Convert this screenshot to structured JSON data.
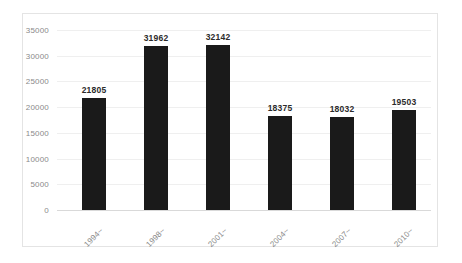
{
  "chart_data": {
    "type": "bar",
    "title": "",
    "subtitle": "",
    "xlabel": "",
    "ylabel": "",
    "categories": [
      "1994~",
      "1998~",
      "2001~",
      "2004~",
      "2007~",
      "2010~"
    ],
    "values": [
      21805,
      31962,
      32142,
      18375,
      18032,
      19503
    ],
    "data_labels": [
      "21805",
      "31962",
      "32142",
      "18375",
      "18032",
      "19503"
    ],
    "ylim": [
      0,
      35000
    ],
    "ytick_values": [
      0,
      5000,
      10000,
      15000,
      20000,
      25000,
      30000,
      35000
    ],
    "ytick_labels": [
      "0",
      "5000",
      "10000",
      "15000",
      "20000",
      "25000",
      "30000",
      "35000"
    ],
    "grid": true,
    "legend": false,
    "legend_position": "none",
    "series": [
      {
        "name": "",
        "values": [
          21805,
          31962,
          32142,
          18375,
          18032,
          19503
        ]
      }
    ]
  },
  "style": {
    "bar_color": "#1a1a1a",
    "gridline_color": "#efefef",
    "axis_color": "#d9d9d9",
    "frame_color": "#e4e4e4",
    "tick_label_color": "#8a8a8a",
    "data_label_color": "#2b2b2b",
    "background_color": "#ffffff"
  }
}
